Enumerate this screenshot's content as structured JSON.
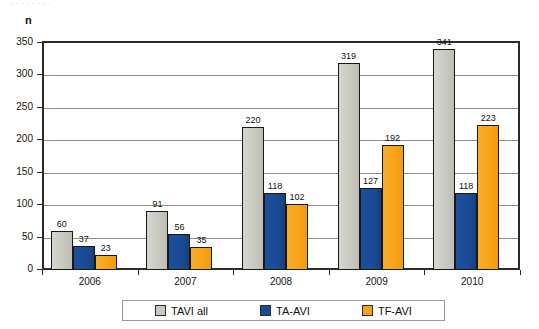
{
  "caption_remnant": "·   ·        ·      ·   ·                         ·              ·     ·",
  "axis_unit_label": "n",
  "legend": {
    "items": [
      {
        "label": "TAVI all",
        "color": "#c9c9c2",
        "swatch_icon": "legend-swatch-gray"
      },
      {
        "label": "TA-AVI",
        "color": "#1c4b95",
        "swatch_icon": "legend-swatch-blue"
      },
      {
        "label": "TF-AVI",
        "color": "#f7a318",
        "swatch_icon": "legend-swatch-orange"
      }
    ]
  },
  "chart_data": {
    "type": "bar",
    "title": "",
    "xlabel": "",
    "ylabel": "n",
    "ylim": [
      0,
      350
    ],
    "yticks": [
      0,
      50,
      100,
      150,
      200,
      250,
      300,
      350
    ],
    "ytick_labels": [
      "0",
      "50",
      "100",
      "150",
      "200",
      "250",
      "300",
      "350"
    ],
    "grid": true,
    "legend_position": "bottom",
    "categories": [
      "2006",
      "2007",
      "2008",
      "2009",
      "2010"
    ],
    "series": [
      {
        "name": "TAVI all",
        "color": "#c9c9c2",
        "values": [
          60,
          91,
          220,
          319,
          341
        ]
      },
      {
        "name": "TA-AVI",
        "color": "#1c4b95",
        "values": [
          37,
          56,
          118,
          127,
          118
        ]
      },
      {
        "name": "TF-AVI",
        "color": "#f7a318",
        "values": [
          23,
          35,
          102,
          192,
          223
        ]
      }
    ]
  }
}
